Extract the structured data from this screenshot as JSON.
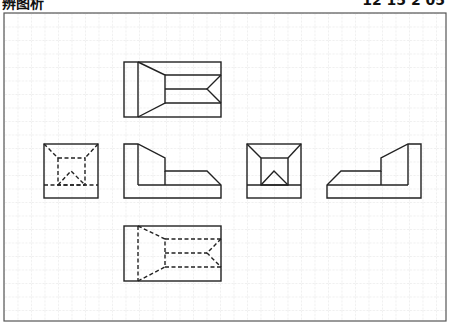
{
  "header": {
    "left_text": "辨图析",
    "right_text": "12 15 2 05"
  },
  "canvas": {
    "width": 451,
    "height": 325,
    "border": {
      "x": 4,
      "y": 13,
      "w": 442,
      "h": 308,
      "color": "#555555"
    },
    "grid": {
      "spacing": 13.5,
      "origin_x": 4,
      "origin_y": 13,
      "color": "#d4d4d4"
    },
    "stroke_color": "#222222"
  },
  "views": [
    {
      "name": "top-view",
      "label": "Top view (solid lines)"
    },
    {
      "name": "left-view-hidden",
      "label": "Square view with hidden lines"
    },
    {
      "name": "front-view",
      "label": "Front L-profile view"
    },
    {
      "name": "center-square-view",
      "label": "Square view with visible inner frame"
    },
    {
      "name": "right-profile-view",
      "label": "Mirrored L-profile view"
    },
    {
      "name": "bottom-view-hidden",
      "label": "Bottom view with hidden lines"
    }
  ]
}
